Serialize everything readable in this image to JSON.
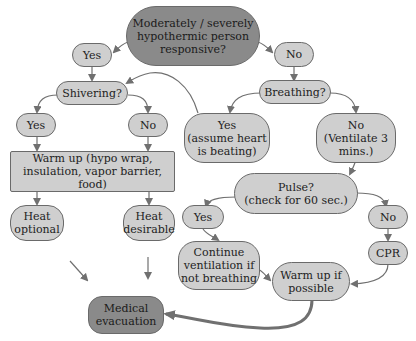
{
  "diagram": {
    "title": "Moderately / severely hypothermic person responsive?",
    "colors": {
      "node_fill": "#cfcfcf",
      "node_fill_dark": "#8a8a8a",
      "node_border": "#6a6a6a",
      "edge": "#707070",
      "text": "#222222"
    },
    "nodes": {
      "root": "Moderately / severely\nhypothermic person\nresponsive?",
      "yes_top": "Yes",
      "no_top": "No",
      "shivering": "Shivering?",
      "breathing": "Breathing?",
      "shiver_yes": "Yes",
      "shiver_no": "No",
      "breath_yes": "Yes\n(assume heart\nis beating)",
      "breath_no": "No\n(Ventilate 3\nmins.)",
      "warm_up": "Warm up (hypo wrap,\ninsulation, vapor barrier, food)",
      "pulse": "Pulse?\n(check for 60 sec.)",
      "heat_optional": "Heat\noptional",
      "heat_desirable": "Heat\ndesirable",
      "pulse_yes": "Yes",
      "pulse_no": "No",
      "continue_vent": "Continue\nventilation if\nnot breathing",
      "cpr": "CPR",
      "warm_if_possible": "Warm up if\npossible",
      "medical_evac": "Medical\nevacuation"
    },
    "edges": [
      {
        "from": "root",
        "to": "yes_top"
      },
      {
        "from": "root",
        "to": "no_top"
      },
      {
        "from": "yes_top",
        "to": "shivering"
      },
      {
        "from": "no_top",
        "to": "breathing"
      },
      {
        "from": "shivering",
        "to": "shiver_yes"
      },
      {
        "from": "shivering",
        "to": "shiver_no"
      },
      {
        "from": "breathing",
        "to": "breath_yes"
      },
      {
        "from": "breathing",
        "to": "breath_no"
      },
      {
        "from": "breath_yes",
        "to": "shivering"
      },
      {
        "from": "shiver_yes",
        "to": "warm_up"
      },
      {
        "from": "shiver_no",
        "to": "warm_up"
      },
      {
        "from": "warm_up",
        "to": "heat_optional"
      },
      {
        "from": "warm_up",
        "to": "heat_desirable"
      },
      {
        "from": "breath_no",
        "to": "pulse"
      },
      {
        "from": "pulse",
        "to": "pulse_yes"
      },
      {
        "from": "pulse",
        "to": "pulse_no"
      },
      {
        "from": "pulse_yes",
        "to": "continue_vent"
      },
      {
        "from": "pulse_no",
        "to": "cpr"
      },
      {
        "from": "continue_vent",
        "to": "warm_if_possible"
      },
      {
        "from": "cpr",
        "to": "warm_if_possible"
      },
      {
        "from": "heat_optional",
        "to": "medical_evac"
      },
      {
        "from": "heat_desirable",
        "to": "medical_evac"
      },
      {
        "from": "warm_if_possible",
        "to": "medical_evac"
      }
    ]
  }
}
